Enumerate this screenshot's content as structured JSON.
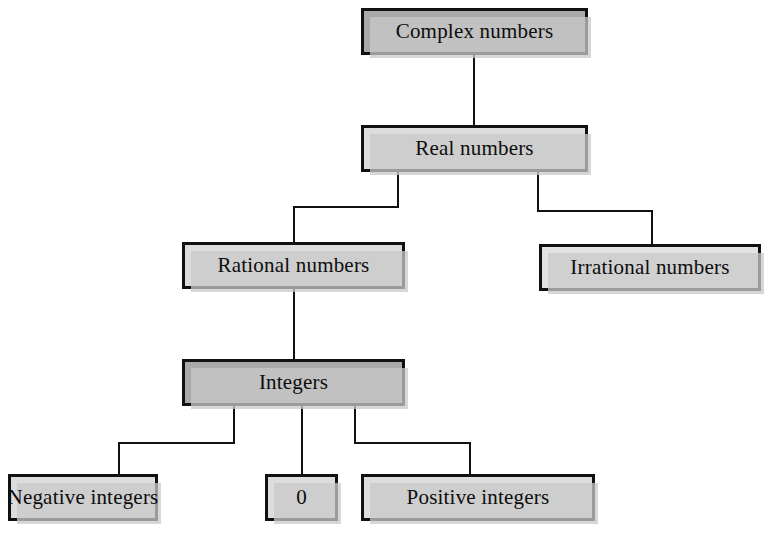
{
  "diagram": {
    "type": "tree-diagram",
    "colors": {
      "border": "#111111",
      "fill_dark": "#a9a9a9",
      "fill_light": "#dcdcdc",
      "fill_pale": "#e2e2e2",
      "shadow": "#c9c9c9",
      "background": "#ffffff",
      "connector": "#111111"
    },
    "nodes": [
      {
        "id": "complex-numbers",
        "label": "Complex numbers",
        "level": 0,
        "fill": "dark",
        "x": 361,
        "y": 8,
        "w": 227,
        "h": 47
      },
      {
        "id": "real-numbers",
        "label": "Real numbers",
        "level": 1,
        "fill": "light",
        "x": 361,
        "y": 125,
        "w": 227,
        "h": 47
      },
      {
        "id": "rational-numbers",
        "label": "Rational numbers",
        "level": 2,
        "fill": "light",
        "x": 182,
        "y": 242,
        "w": 223,
        "h": 47
      },
      {
        "id": "irrational-numbers",
        "label": "Irrational numbers",
        "level": 2,
        "fill": "pale",
        "x": 539,
        "y": 244,
        "w": 222,
        "h": 47
      },
      {
        "id": "integers",
        "label": "Integers",
        "level": 3,
        "fill": "dark",
        "x": 182,
        "y": 359,
        "w": 223,
        "h": 47
      },
      {
        "id": "negative-integers",
        "label": "Negative integers",
        "level": 4,
        "fill": "light",
        "x": 8,
        "y": 474,
        "w": 150,
        "h": 47
      },
      {
        "id": "zero",
        "label": "0",
        "level": 4,
        "fill": "light",
        "x": 265,
        "y": 474,
        "w": 73,
        "h": 47
      },
      {
        "id": "positive-integers",
        "label": "Positive integers",
        "level": 4,
        "fill": "light",
        "x": 361,
        "y": 474,
        "w": 234,
        "h": 47
      }
    ],
    "edges": [
      {
        "id": "complex-to-real",
        "from": "complex-numbers",
        "to": "real-numbers",
        "points": "474,55 474,125"
      },
      {
        "id": "real-to-rational",
        "from": "real-numbers",
        "to": "rational-numbers",
        "points": "398,172 398,207 294,207 294,242"
      },
      {
        "id": "real-to-irrational",
        "from": "real-numbers",
        "to": "irrational-numbers",
        "points": "538,172 538,211 652,211 652,244"
      },
      {
        "id": "rational-to-integers",
        "from": "rational-numbers",
        "to": "integers",
        "points": "294,289 294,359"
      },
      {
        "id": "integers-to-negative",
        "from": "integers",
        "to": "negative-integers",
        "points": "234,406 234,443 119,443 119,474"
      },
      {
        "id": "integers-to-zero",
        "from": "integers",
        "to": "zero",
        "points": "302,406 302,474"
      },
      {
        "id": "integers-to-positive",
        "from": "integers",
        "to": "positive-integers",
        "points": "355,406 355,443 470,443 470,474"
      }
    ]
  }
}
